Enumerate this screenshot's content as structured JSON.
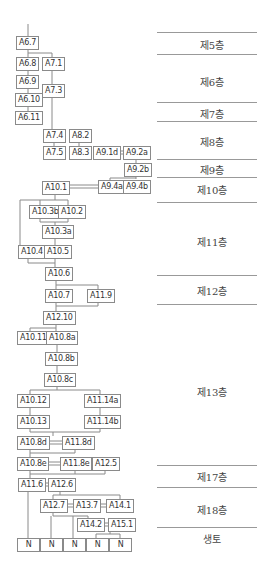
{
  "diagram": {
    "nodes": [
      {
        "id": "A6.7",
        "label": "A6.7"
      },
      {
        "id": "A6.8",
        "label": "A6.8"
      },
      {
        "id": "A7.1",
        "label": "A7.1"
      },
      {
        "id": "A6.9",
        "label": "A6.9"
      },
      {
        "id": "A7.3",
        "label": "A7.3"
      },
      {
        "id": "A6.10",
        "label": "A6.10"
      },
      {
        "id": "A6.11",
        "label": "A6.11"
      },
      {
        "id": "A7.4",
        "label": "A7.4"
      },
      {
        "id": "A8.2",
        "label": "A8.2"
      },
      {
        "id": "A7.5",
        "label": "A7.5"
      },
      {
        "id": "A8.3",
        "label": "A8.3"
      },
      {
        "id": "A9.1d",
        "label": "A9.1d"
      },
      {
        "id": "A9.2a",
        "label": "A9.2a"
      },
      {
        "id": "A9.2b",
        "label": "A9.2b"
      },
      {
        "id": "A10.1",
        "label": "A10.1"
      },
      {
        "id": "A9.4a",
        "label": "A9.4a"
      },
      {
        "id": "A9.4b",
        "label": "A9.4b"
      },
      {
        "id": "A10.3b",
        "label": "A10.3b"
      },
      {
        "id": "A10.2",
        "label": "A10.2"
      },
      {
        "id": "A10.3a",
        "label": "A10.3a"
      },
      {
        "id": "A10.4",
        "label": "A10.4"
      },
      {
        "id": "A10.5",
        "label": "A10.5"
      },
      {
        "id": "A10.6",
        "label": "A10.6"
      },
      {
        "id": "A10.7",
        "label": "A10.7"
      },
      {
        "id": "A11.9",
        "label": "A11.9"
      },
      {
        "id": "A12.10",
        "label": "A12.10"
      },
      {
        "id": "A10.11",
        "label": "A10.11"
      },
      {
        "id": "A10.8a",
        "label": "A10.8a"
      },
      {
        "id": "A10.8b",
        "label": "A10.8b"
      },
      {
        "id": "A10.8c",
        "label": "A10.8c"
      },
      {
        "id": "A10.12",
        "label": "A10.12"
      },
      {
        "id": "A11.14a",
        "label": "A11.14a"
      },
      {
        "id": "A10.13",
        "label": "A10.13"
      },
      {
        "id": "A11.14b",
        "label": "A11.14b"
      },
      {
        "id": "A10.8d",
        "label": "A10.8d"
      },
      {
        "id": "A11.8d",
        "label": "A11.8d"
      },
      {
        "id": "A10.8e",
        "label": "A10.8e"
      },
      {
        "id": "A11.8e",
        "label": "A11.8e"
      },
      {
        "id": "A12.5",
        "label": "A12.5"
      },
      {
        "id": "A11.6",
        "label": "A11.6"
      },
      {
        "id": "A12.6",
        "label": "A12.6"
      },
      {
        "id": "A12.7",
        "label": "A12.7"
      },
      {
        "id": "A13.7",
        "label": "A13.7"
      },
      {
        "id": "A14.1",
        "label": "A14.1"
      },
      {
        "id": "A14.2",
        "label": "A14.2"
      },
      {
        "id": "A15.1",
        "label": "A15.1"
      },
      {
        "id": "N1",
        "label": "N"
      },
      {
        "id": "N2",
        "label": "N"
      },
      {
        "id": "N3",
        "label": "N"
      },
      {
        "id": "N4",
        "label": "N"
      },
      {
        "id": "N5",
        "label": "N"
      }
    ],
    "layers": [
      {
        "label": "제5층"
      },
      {
        "label": "제6층"
      },
      {
        "label": "제7층"
      },
      {
        "label": "제8층"
      },
      {
        "label": "제9층"
      },
      {
        "label": "제10층"
      },
      {
        "label": "제11층"
      },
      {
        "label": "제12층"
      },
      {
        "label": "제13층"
      },
      {
        "label": "제17층"
      },
      {
        "label": "제18층"
      },
      {
        "label": "생토"
      }
    ]
  }
}
